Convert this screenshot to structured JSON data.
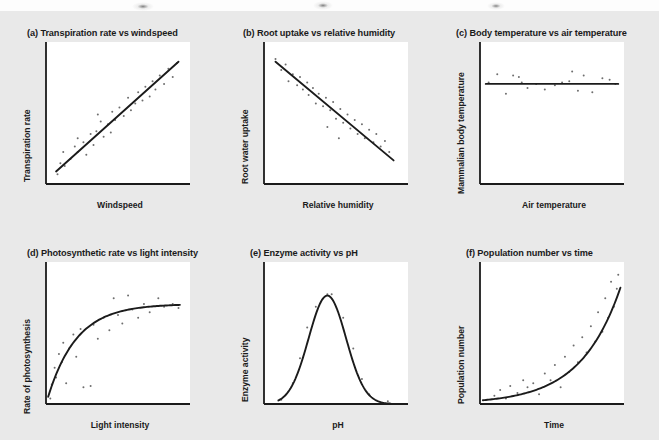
{
  "figure": {
    "background_color": "#e9e9e9",
    "plot_background_color": "#ffffff",
    "ink_color": "#1b1b1b",
    "point_color": "#6e6e6e",
    "scan_artifacts": [
      {
        "name": "smudge-left",
        "x": 132,
        "y": 2,
        "w": 22,
        "h": 9
      },
      {
        "name": "smudge-center",
        "x": 313,
        "y": 1,
        "w": 20,
        "h": 9
      },
      {
        "name": "smudge-right",
        "x": 487,
        "y": 2,
        "w": 18,
        "h": 8
      }
    ]
  },
  "chart_data": [
    {
      "id": "a",
      "type": "scatter",
      "title": "(a) Transpiration rate vs windspeed",
      "xlabel": "Windspeed",
      "ylabel": "Transpiration rate",
      "relationship": "positive linear correlation",
      "xlim": [
        0,
        1
      ],
      "ylim": [
        0,
        1
      ],
      "grid": false,
      "legend": "none",
      "trendline": {
        "kind": "linear",
        "x": [
          0.07,
          0.92
        ],
        "y": [
          0.09,
          0.88
        ]
      },
      "points": [
        [
          0.08,
          0.07
        ],
        [
          0.1,
          0.15
        ],
        [
          0.13,
          0.13
        ],
        [
          0.12,
          0.23
        ],
        [
          0.17,
          0.18
        ],
        [
          0.2,
          0.27
        ],
        [
          0.22,
          0.23
        ],
        [
          0.22,
          0.33
        ],
        [
          0.26,
          0.3
        ],
        [
          0.28,
          0.21
        ],
        [
          0.31,
          0.36
        ],
        [
          0.33,
          0.28
        ],
        [
          0.35,
          0.38
        ],
        [
          0.38,
          0.45
        ],
        [
          0.4,
          0.34
        ],
        [
          0.43,
          0.43
        ],
        [
          0.46,
          0.52
        ],
        [
          0.48,
          0.46
        ],
        [
          0.51,
          0.55
        ],
        [
          0.54,
          0.49
        ],
        [
          0.57,
          0.62
        ],
        [
          0.59,
          0.53
        ],
        [
          0.62,
          0.58
        ],
        [
          0.64,
          0.66
        ],
        [
          0.67,
          0.6
        ],
        [
          0.69,
          0.7
        ],
        [
          0.72,
          0.63
        ],
        [
          0.74,
          0.74
        ],
        [
          0.76,
          0.68
        ],
        [
          0.79,
          0.78
        ],
        [
          0.82,
          0.72
        ],
        [
          0.85,
          0.83
        ],
        [
          0.88,
          0.77
        ],
        [
          0.91,
          0.87
        ],
        [
          0.45,
          0.37
        ],
        [
          0.36,
          0.5
        ]
      ]
    },
    {
      "id": "b",
      "type": "scatter",
      "title": "(b) Root uptake vs relative humidity",
      "xlabel": "Relative humidity",
      "ylabel": "Root water uptake",
      "relationship": "negative linear correlation",
      "xlim": [
        0,
        1
      ],
      "ylim": [
        0,
        1
      ],
      "grid": false,
      "legend": "none",
      "trendline": {
        "kind": "linear",
        "x": [
          0.08,
          0.9
        ],
        "y": [
          0.88,
          0.17
        ]
      },
      "points": [
        [
          0.08,
          0.9
        ],
        [
          0.12,
          0.82
        ],
        [
          0.15,
          0.86
        ],
        [
          0.17,
          0.74
        ],
        [
          0.2,
          0.79
        ],
        [
          0.23,
          0.71
        ],
        [
          0.25,
          0.77
        ],
        [
          0.27,
          0.68
        ],
        [
          0.3,
          0.73
        ],
        [
          0.31,
          0.64
        ],
        [
          0.34,
          0.69
        ],
        [
          0.36,
          0.58
        ],
        [
          0.38,
          0.65
        ],
        [
          0.41,
          0.56
        ],
        [
          0.43,
          0.62
        ],
        [
          0.46,
          0.53
        ],
        [
          0.48,
          0.59
        ],
        [
          0.5,
          0.47
        ],
        [
          0.53,
          0.54
        ],
        [
          0.55,
          0.44
        ],
        [
          0.58,
          0.5
        ],
        [
          0.6,
          0.4
        ],
        [
          0.63,
          0.46
        ],
        [
          0.65,
          0.36
        ],
        [
          0.68,
          0.43
        ],
        [
          0.7,
          0.33
        ],
        [
          0.73,
          0.39
        ],
        [
          0.76,
          0.3
        ],
        [
          0.78,
          0.36
        ],
        [
          0.81,
          0.27
        ],
        [
          0.84,
          0.31
        ],
        [
          0.87,
          0.23
        ],
        [
          0.52,
          0.33
        ],
        [
          0.44,
          0.41
        ]
      ]
    },
    {
      "id": "c",
      "type": "scatter",
      "title": "(c) Body temperature vs air temperature",
      "xlabel": "Air temperature",
      "ylabel": "Mammalian body temperature",
      "relationship": "no correlation (flat)",
      "xlim": [
        0,
        1
      ],
      "ylim": [
        0,
        1
      ],
      "grid": false,
      "legend": "none",
      "trendline": {
        "kind": "linear",
        "x": [
          0.04,
          0.96
        ],
        "y": [
          0.72,
          0.72
        ]
      },
      "points": [
        [
          0.06,
          0.73
        ],
        [
          0.12,
          0.79
        ],
        [
          0.18,
          0.65
        ],
        [
          0.23,
          0.78
        ],
        [
          0.27,
          0.77
        ],
        [
          0.29,
          0.73
        ],
        [
          0.33,
          0.69
        ],
        [
          0.39,
          0.72
        ],
        [
          0.45,
          0.68
        ],
        [
          0.52,
          0.71
        ],
        [
          0.57,
          0.73
        ],
        [
          0.62,
          0.74
        ],
        [
          0.64,
          0.81
        ],
        [
          0.68,
          0.67
        ],
        [
          0.72,
          0.78
        ],
        [
          0.78,
          0.66
        ],
        [
          0.85,
          0.76
        ],
        [
          0.9,
          0.75
        ],
        [
          0.94,
          0.72
        ]
      ]
    },
    {
      "id": "d",
      "type": "scatter",
      "title": "(d) Photosynthetic rate vs light intensity",
      "xlabel": "Light intensity",
      "ylabel": "Rate of photosynthesis",
      "relationship": "saturating / plateau curve",
      "xlim": [
        0,
        1
      ],
      "ylim": [
        0,
        1
      ],
      "grid": false,
      "legend": "none",
      "trendline": {
        "kind": "saturating",
        "asymptote": 0.72,
        "rate": 5.0
      },
      "points": [
        [
          0.03,
          0.04
        ],
        [
          0.04,
          0.14
        ],
        [
          0.06,
          0.26
        ],
        [
          0.07,
          0.19
        ],
        [
          0.09,
          0.36
        ],
        [
          0.11,
          0.3
        ],
        [
          0.12,
          0.44
        ],
        [
          0.14,
          0.15
        ],
        [
          0.16,
          0.4
        ],
        [
          0.19,
          0.5
        ],
        [
          0.21,
          0.34
        ],
        [
          0.24,
          0.54
        ],
        [
          0.26,
          0.12
        ],
        [
          0.31,
          0.13
        ],
        [
          0.33,
          0.57
        ],
        [
          0.36,
          0.47
        ],
        [
          0.4,
          0.62
        ],
        [
          0.44,
          0.53
        ],
        [
          0.47,
          0.76
        ],
        [
          0.5,
          0.64
        ],
        [
          0.53,
          0.58
        ],
        [
          0.57,
          0.78
        ],
        [
          0.6,
          0.68
        ],
        [
          0.64,
          0.62
        ],
        [
          0.68,
          0.72
        ],
        [
          0.72,
          0.66
        ],
        [
          0.78,
          0.76
        ],
        [
          0.82,
          0.7
        ],
        [
          0.88,
          0.72
        ],
        [
          0.92,
          0.69
        ]
      ]
    },
    {
      "id": "e",
      "type": "scatter",
      "title": "(e) Enzyme activity vs pH",
      "xlabel": "pH",
      "ylabel": "Enzyme activity",
      "relationship": "optimum (bell-shaped) curve",
      "xlim": [
        0,
        1
      ],
      "ylim": [
        0,
        1
      ],
      "grid": false,
      "legend": "none",
      "trendline": {
        "kind": "gaussian",
        "mean": 0.44,
        "sigma": 0.13,
        "peak": 0.78
      },
      "points": [
        [
          0.12,
          0.03
        ],
        [
          0.2,
          0.15
        ],
        [
          0.25,
          0.33
        ],
        [
          0.3,
          0.55
        ],
        [
          0.36,
          0.7
        ],
        [
          0.44,
          0.79
        ],
        [
          0.47,
          0.79
        ],
        [
          0.55,
          0.62
        ],
        [
          0.62,
          0.4
        ],
        [
          0.68,
          0.18
        ],
        [
          0.73,
          0.07
        ],
        [
          0.86,
          0.02
        ]
      ]
    },
    {
      "id": "f",
      "type": "scatter",
      "title": "(f) Population number vs time",
      "xlabel": "Time",
      "ylabel": "Population number",
      "relationship": "exponential growth",
      "xlim": [
        0,
        1
      ],
      "ylim": [
        0,
        1
      ],
      "grid": false,
      "legend": "none",
      "trendline": {
        "kind": "exponential",
        "base": 0.025,
        "growth": 3.6
      },
      "points": [
        [
          0.1,
          0.06
        ],
        [
          0.14,
          0.1
        ],
        [
          0.18,
          0.04
        ],
        [
          0.21,
          0.13
        ],
        [
          0.26,
          0.08
        ],
        [
          0.3,
          0.17
        ],
        [
          0.33,
          0.12
        ],
        [
          0.37,
          0.15
        ],
        [
          0.41,
          0.07
        ],
        [
          0.45,
          0.22
        ],
        [
          0.49,
          0.17
        ],
        [
          0.52,
          0.28
        ],
        [
          0.56,
          0.12
        ],
        [
          0.59,
          0.34
        ],
        [
          0.62,
          0.23
        ],
        [
          0.65,
          0.42
        ],
        [
          0.68,
          0.3
        ],
        [
          0.71,
          0.48
        ],
        [
          0.74,
          0.37
        ],
        [
          0.77,
          0.56
        ],
        [
          0.8,
          0.45
        ],
        [
          0.82,
          0.66
        ],
        [
          0.85,
          0.52
        ],
        [
          0.87,
          0.76
        ],
        [
          0.89,
          0.62
        ],
        [
          0.91,
          0.88
        ],
        [
          0.93,
          0.7
        ],
        [
          0.95,
          0.83
        ],
        [
          0.96,
          0.93
        ]
      ]
    }
  ],
  "panels": {
    "a": {
      "title": "(a) Transpiration rate vs windspeed",
      "xlabel": "Windspeed",
      "ylabel": "Transpiration rate"
    },
    "b": {
      "title": "(b) Root uptake vs relative humidity",
      "xlabel": "Relative humidity",
      "ylabel": "Root water uptake"
    },
    "c": {
      "title": "(c) Body temperature vs air temperature",
      "xlabel": "Air temperature",
      "ylabel": "Mammalian body temperature"
    },
    "d": {
      "title": "(d) Photosynthetic rate vs light intensity",
      "xlabel": "Light intensity",
      "ylabel": "Rate of photosynthesis"
    },
    "e": {
      "title": "(e) Enzyme activity vs pH",
      "xlabel": "pH",
      "ylabel": "Enzyme activity"
    },
    "f": {
      "title": "(f) Population number vs time",
      "xlabel": "Time",
      "ylabel": "Population number"
    }
  }
}
